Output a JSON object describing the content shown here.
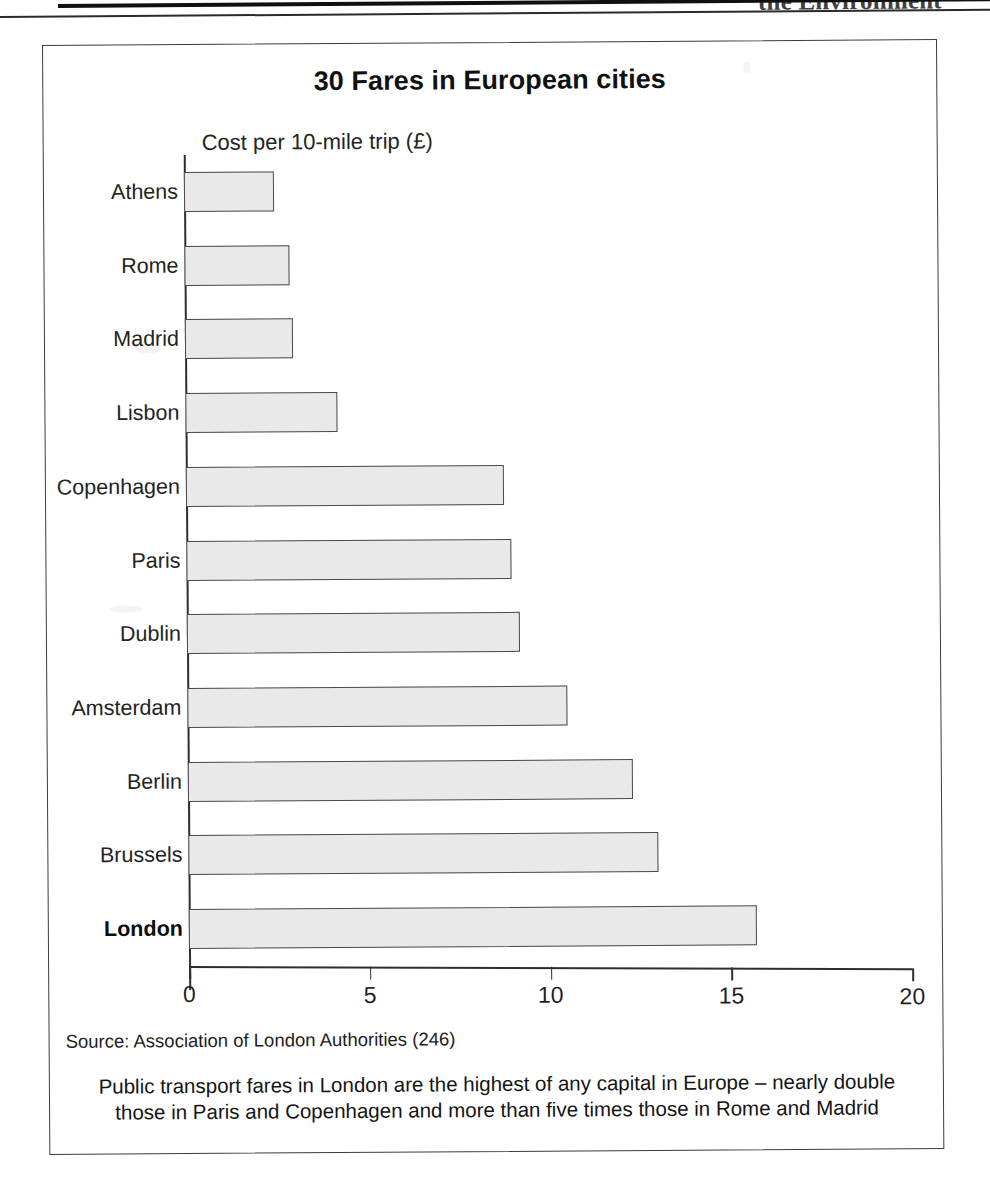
{
  "page_header": {
    "text": "the Environment"
  },
  "figure": {
    "title": "30 Fares in European cities",
    "source": "Source: Association of London Authorities (246)",
    "caption": "Public transport fares in London are the highest of any capital in Europe – nearly double those in Paris and Copenhagen and more than five times those in Rome and Madrid"
  },
  "chart_data": {
    "type": "bar",
    "orientation": "horizontal",
    "title": "30 Fares in European cities",
    "xlabel": "Cost per 10-mile trip (£)",
    "ylabel": "",
    "xlim": [
      0,
      20
    ],
    "xticks": [
      0,
      5,
      10,
      15,
      20
    ],
    "xtick_labels": [
      "0",
      "5",
      "10",
      "15",
      "20"
    ],
    "grid": false,
    "legend": false,
    "bar_fill_color": "#e9e9e9",
    "bar_border_color": "#4a4a4a",
    "highlight_category": "London",
    "categories": [
      "Athens",
      "Rome",
      "Madrid",
      "Lisbon",
      "Copenhagen",
      "Paris",
      "Dublin",
      "Amsterdam",
      "Berlin",
      "Brussels",
      "London"
    ],
    "values": [
      2.5,
      2.9,
      3.0,
      4.2,
      8.8,
      9.0,
      9.2,
      10.5,
      12.3,
      13.0,
      15.7
    ],
    "bars": [
      {
        "label": "Athens",
        "value": 2.5,
        "bold": false
      },
      {
        "label": "Rome",
        "value": 2.9,
        "bold": false
      },
      {
        "label": "Madrid",
        "value": 3.0,
        "bold": false
      },
      {
        "label": "Lisbon",
        "value": 4.2,
        "bold": false
      },
      {
        "label": "Copenhagen",
        "value": 8.8,
        "bold": false
      },
      {
        "label": "Paris",
        "value": 9.0,
        "bold": false
      },
      {
        "label": "Dublin",
        "value": 9.2,
        "bold": false
      },
      {
        "label": "Amsterdam",
        "value": 10.5,
        "bold": false
      },
      {
        "label": "Berlin",
        "value": 12.3,
        "bold": false
      },
      {
        "label": "Brussels",
        "value": 13.0,
        "bold": false
      },
      {
        "label": "London",
        "value": 15.7,
        "bold": true
      }
    ]
  }
}
